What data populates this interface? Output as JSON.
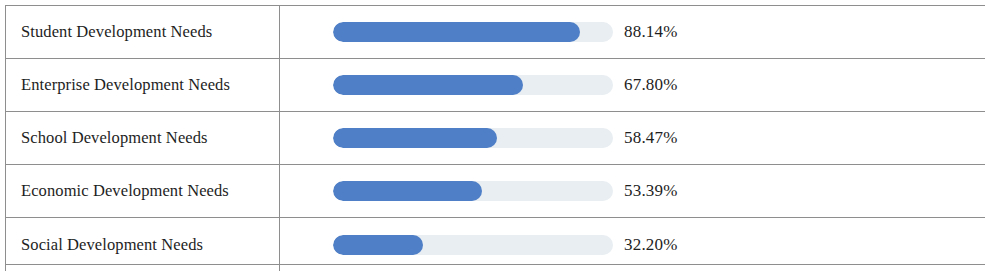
{
  "table": {
    "accent_color": "#4f7fc6",
    "track_color": "#e9eef2",
    "border_color": "#8e8e8e",
    "text_color": "#1e1e1e",
    "rows": [
      {
        "label": "Student Development Needs",
        "value_text": "88.14%",
        "value": 88.14
      },
      {
        "label": "Enterprise Development Needs",
        "value_text": "67.80%",
        "value": 67.8
      },
      {
        "label": "School Development Needs",
        "value_text": "58.47%",
        "value": 58.47
      },
      {
        "label": "Economic Development Needs",
        "value_text": "53.39%",
        "value": 53.39
      },
      {
        "label": "Social Development Needs",
        "value_text": "32.20%",
        "value": 32.2
      }
    ]
  },
  "chart_data": {
    "type": "bar",
    "title": "",
    "xlabel": "",
    "ylabel": "",
    "orientation": "horizontal",
    "categories": [
      "Student Development Needs",
      "Enterprise Development Needs",
      "School Development Needs",
      "Economic Development Needs",
      "Social Development Needs"
    ],
    "values": [
      88.14,
      67.8,
      58.47,
      53.39,
      32.2
    ],
    "value_labels": [
      "88.14%",
      "67.80%",
      "58.47%",
      "53.39%",
      "32.20%"
    ],
    "xlim": [
      0,
      100
    ],
    "units": "percent",
    "grid": false,
    "legend": "none"
  }
}
